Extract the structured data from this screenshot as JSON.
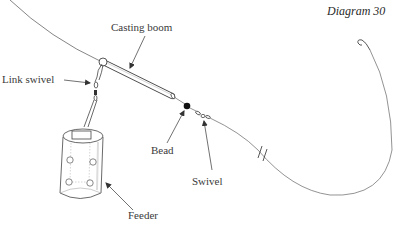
{
  "diagram": {
    "title": "Diagram 30",
    "labels": {
      "casting_boom": "Casting boom",
      "link_swivel": "Link swivel",
      "bead": "Bead",
      "swivel": "Swivel",
      "feeder": "Feeder"
    },
    "colors": {
      "line": "#555555",
      "stroke": "#444444",
      "bead": "#111111",
      "background": "#ffffff"
    }
  }
}
